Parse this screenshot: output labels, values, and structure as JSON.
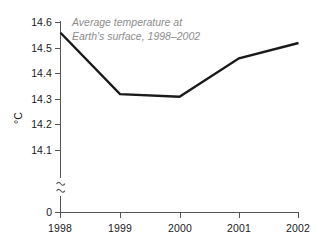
{
  "chart_data": {
    "type": "line",
    "title": "Average temperature at\nEarth's surface, 1998–2002",
    "title_color": "#8d8d8d",
    "xlabel": "",
    "ylabel": "°C",
    "categories": [
      "1998",
      "1999",
      "2000",
      "2001",
      "2002"
    ],
    "x": [
      1998,
      1999,
      2000,
      2001,
      2002
    ],
    "values": [
      14.56,
      14.32,
      14.31,
      14.46,
      14.52
    ],
    "series": [
      {
        "name": "Average temperature at Earth's surface",
        "values": [
          14.56,
          14.32,
          14.31,
          14.46,
          14.52
        ],
        "color": "#1a1a1a",
        "line_width": 2.4
      }
    ],
    "ylim": [
      14.05,
      14.6
    ],
    "y_ticks": [
      "14.6",
      "14.5",
      "14.4",
      "14.3",
      "14.2",
      "14.1"
    ],
    "y_tick_values": [
      14.6,
      14.5,
      14.4,
      14.3,
      14.2,
      14.1
    ],
    "y_axis_break": true,
    "y_axis_break_symbol": "≈",
    "y_origin_label": "0",
    "grid": false,
    "legend": "none",
    "axis_color": "#555555",
    "line_color": "#1a1a1a",
    "background": "#ffffff"
  },
  "axes": {
    "y_title": "°C",
    "y_tick_labels": [
      "14.6",
      "14.5",
      "14.4",
      "14.3",
      "14.2",
      "14.1"
    ],
    "y_zero_label": "0",
    "x_tick_labels": [
      "1998",
      "1999",
      "2000",
      "2001",
      "2002"
    ]
  },
  "annotations": {
    "title_line1": "Average temperature at",
    "title_line2": "Earth's surface, 1998–2002"
  }
}
